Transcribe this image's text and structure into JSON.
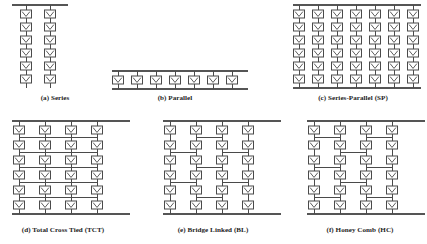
{
  "figure": {
    "background_color": "#ffffff",
    "line_color": "#4a4a4a",
    "cell_fill": "#ffffff",
    "caption_color": "#1d1d1d",
    "cell_symbol": "pv-cell-chevron",
    "canvas": {
      "width": 427,
      "height": 244
    }
  },
  "panels": [
    {
      "id": "series",
      "caption": "(a) Series",
      "topology": "series",
      "rows": 6,
      "columns": 2,
      "caption_x": 55,
      "caption_y": 100,
      "origin_x": 26,
      "origin_y": 14,
      "col_pitch": 24,
      "row_pitch": 13,
      "bus_left": 12,
      "bus_right": 68,
      "ties": []
    },
    {
      "id": "parallel",
      "caption": "(b) Parallel",
      "topology": "parallel",
      "rows": 1,
      "columns": 7,
      "caption_x": 175,
      "caption_y": 100,
      "origin_x": 118,
      "origin_y": 80,
      "col_pitch": 19,
      "row_pitch": 13,
      "bus_left": 112,
      "bus_right": 248,
      "ties": []
    },
    {
      "id": "series-parallel",
      "caption": "(c) Series-Parallel (SP)",
      "topology": "series-parallel",
      "rows": 6,
      "columns": 7,
      "caption_x": 353,
      "caption_y": 100,
      "origin_x": 299,
      "origin_y": 14,
      "col_pitch": 19,
      "row_pitch": 13,
      "bus_left": 293,
      "bus_right": 421,
      "ties": []
    },
    {
      "id": "total-cross-tied",
      "caption": "(d) Total Cross Tied (TCT)",
      "topology": "total-cross-tied",
      "rows": 6,
      "columns": 4,
      "caption_x": 63,
      "caption_y": 232,
      "origin_x": 19,
      "origin_y": 130,
      "col_pitch": 26,
      "row_pitch": 15,
      "bus_left": 12,
      "bus_right": 130,
      "ties": [
        {
          "row": 0,
          "from": 0,
          "to": 3
        },
        {
          "row": 1,
          "from": 0,
          "to": 3
        },
        {
          "row": 2,
          "from": 0,
          "to": 3
        },
        {
          "row": 3,
          "from": 0,
          "to": 3
        },
        {
          "row": 4,
          "from": 0,
          "to": 3
        }
      ]
    },
    {
      "id": "bridge-linked",
      "caption": "(e) Bridge Linked (BL)",
      "topology": "bridge-linked",
      "rows": 6,
      "columns": 4,
      "caption_x": 213,
      "caption_y": 232,
      "origin_x": 170,
      "origin_y": 130,
      "col_pitch": 26,
      "row_pitch": 15,
      "bus_left": 163,
      "bus_right": 281,
      "ties": [
        {
          "row": 0,
          "from": 1,
          "to": 2
        },
        {
          "row": 1,
          "from": 0,
          "to": 1
        },
        {
          "row": 1,
          "from": 2,
          "to": 3
        },
        {
          "row": 2,
          "from": 1,
          "to": 2
        },
        {
          "row": 3,
          "from": 0,
          "to": 1
        },
        {
          "row": 3,
          "from": 2,
          "to": 3
        },
        {
          "row": 4,
          "from": 1,
          "to": 2
        }
      ]
    },
    {
      "id": "honey-comb",
      "caption": "(f) Honey Comb (HC)",
      "topology": "honey-comb",
      "rows": 6,
      "columns": 4,
      "caption_x": 360,
      "caption_y": 232,
      "origin_x": 314,
      "origin_y": 130,
      "col_pitch": 26,
      "row_pitch": 15,
      "bus_left": 307,
      "bus_right": 425,
      "ties": [
        {
          "row": 0,
          "from": 0,
          "to": 1
        },
        {
          "row": 0,
          "from": 2,
          "to": 3
        },
        {
          "row": 1,
          "from": 1,
          "to": 2
        },
        {
          "row": 2,
          "from": 0,
          "to": 1
        },
        {
          "row": 2,
          "from": 2,
          "to": 3
        },
        {
          "row": 3,
          "from": 1,
          "to": 2
        },
        {
          "row": 4,
          "from": 0,
          "to": 1
        },
        {
          "row": 4,
          "from": 2,
          "to": 3
        }
      ]
    }
  ],
  "cell_geometry": {
    "width": 11,
    "height": 8,
    "lead_length": 5
  }
}
